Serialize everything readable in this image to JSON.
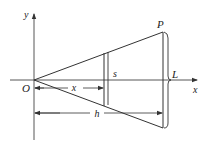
{
  "diagram": {
    "labels": {
      "y_axis": "y",
      "x_axis": "x",
      "origin": "O",
      "point": "P",
      "cross_section": "s",
      "length": "L",
      "x_dim": "x",
      "h_dim": "h"
    },
    "colors": {
      "stroke": "#333333",
      "background": "#ffffff"
    }
  }
}
